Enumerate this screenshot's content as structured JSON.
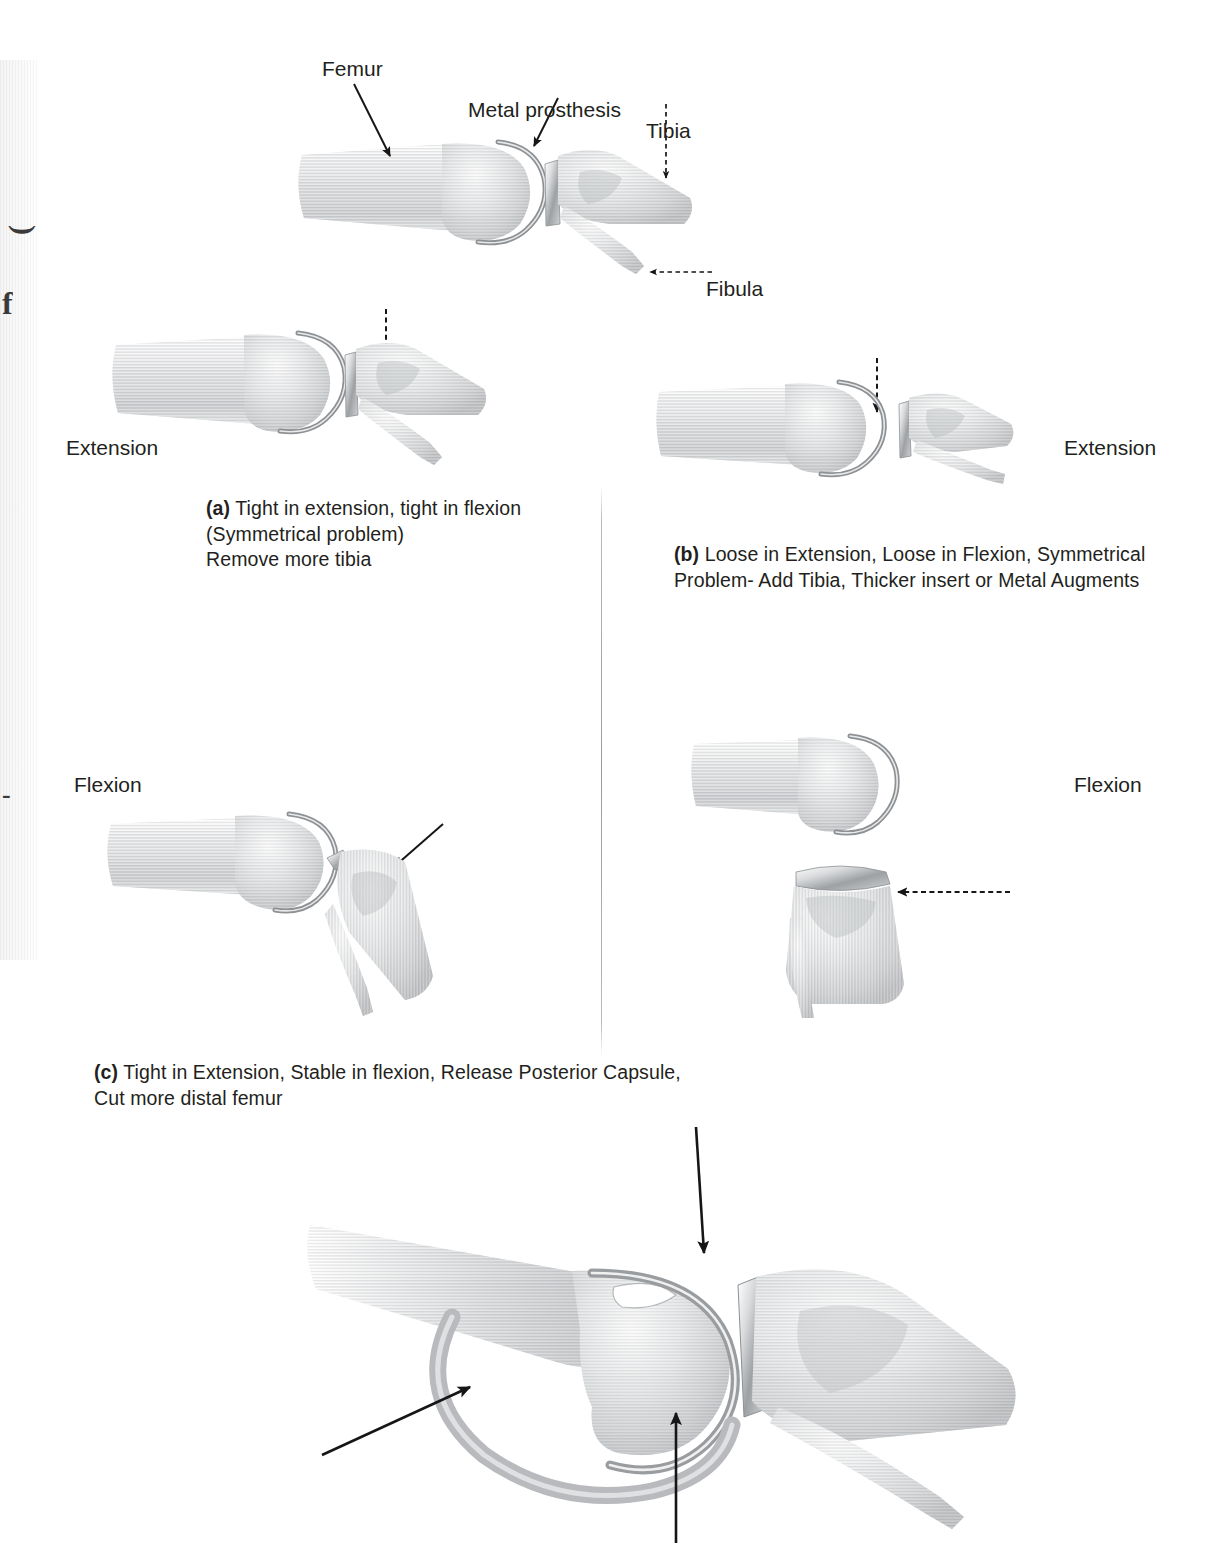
{
  "figure": {
    "domain_note": "Knee arthroplasty gap-balancing figure",
    "background_color": "#ffffff",
    "ink_color": "#231f20",
    "divider_color": "#9a9a9a"
  },
  "margin_artifact": {
    "present": true,
    "glyphs": [
      "(",
      "f",
      "-"
    ],
    "note": "cut-off rotated page-margin text"
  },
  "anatomy_labels": [
    {
      "id": "femur",
      "text": "Femur",
      "arrow": "solid-diagonal-down-right"
    },
    {
      "id": "metal-prosthesis",
      "text": "Metal prosthesis",
      "arrow": "solid-diagonal-down-right"
    },
    {
      "id": "tibia",
      "text": "Tibia",
      "arrow": "dashed-down"
    },
    {
      "id": "fibula",
      "text": "Fibula",
      "arrow": "dashed-left"
    }
  ],
  "state_labels": {
    "extension_left": "Extension",
    "extension_right": "Extension",
    "flexion_left": "Flexion",
    "flexion_right": "Flexion"
  },
  "captions": {
    "a": {
      "marker": "(a)",
      "lines": [
        " Tight in extension, tight in flexion",
        "(Symmetrical problem)",
        "Remove more tibia"
      ]
    },
    "b": {
      "marker": "(b)",
      "lines": [
        " Loose in Extension, Loose in Flexion, Symmetrical",
        "Problem- Add Tibia, Thicker insert or Metal Augments"
      ]
    },
    "c": {
      "marker": "(c)",
      "lines": [
        " Tight in Extension, Stable in flexion, Release Posterior Capsule,",
        "Cut more distal femur"
      ]
    }
  },
  "panels": [
    {
      "id": "overview",
      "title": "Labeled prosthetic knee overview",
      "arrows": 4
    },
    {
      "id": "a-extension",
      "title": "Tight extension",
      "arrows": 1,
      "arrow_style": "dashed-down"
    },
    {
      "id": "b-extension",
      "title": "Loose extension",
      "arrows": 1,
      "arrow_style": "dashed-down"
    },
    {
      "id": "c-flexion",
      "title": "Stable flexion",
      "arrows": 1,
      "arrow_style": "solid-diagonal"
    },
    {
      "id": "b-flexion",
      "title": "Loose flexion",
      "arrows": 1,
      "arrow_style": "dashed-left"
    },
    {
      "id": "posterior-capsule",
      "title": "Posterior capsule release",
      "arrows": 3,
      "arrow_style": "solid"
    }
  ]
}
